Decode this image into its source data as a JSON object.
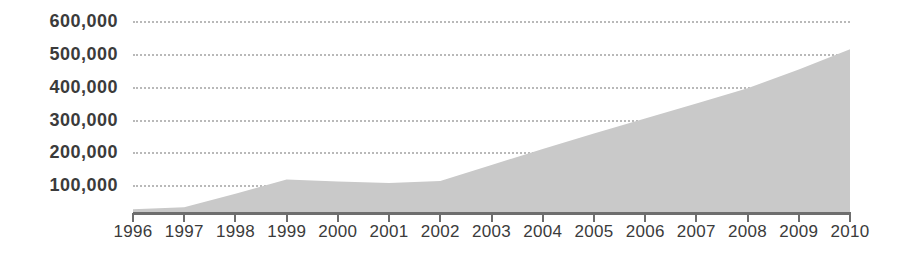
{
  "chart_data": {
    "type": "area",
    "title": "",
    "subtitle": "",
    "xlabel": "",
    "ylabel": "",
    "categories": [
      "1996",
      "1997",
      "1998",
      "1999",
      "2000",
      "2001",
      "2002",
      "2003",
      "2004",
      "2005",
      "2006",
      "2007",
      "2008",
      "2009",
      "2010"
    ],
    "values": [
      12000,
      18000,
      60000,
      105000,
      98000,
      94000,
      100000,
      150000,
      200000,
      248000,
      295000,
      342000,
      390000,
      448000,
      512000
    ],
    "series": [
      {
        "name": "Total",
        "values": [
          12000,
          18000,
          60000,
          105000,
          98000,
          94000,
          100000,
          150000,
          200000,
          248000,
          295000,
          342000,
          390000,
          448000,
          512000
        ]
      }
    ],
    "ylim": [
      0,
      600000
    ],
    "xlim": [
      "1996",
      "2010"
    ],
    "y_ticks": [
      600000,
      500000,
      400000,
      300000,
      200000,
      100000
    ],
    "y_tick_labels": [
      "600,000",
      "500,000",
      "400,000",
      "300,000",
      "200,000",
      "100,000"
    ],
    "x_tick_labels": [
      "1996",
      "1997",
      "1998",
      "1999",
      "2000",
      "2001",
      "2002",
      "2003",
      "2004",
      "2005",
      "2006",
      "2007",
      "2008",
      "2009",
      "2010"
    ],
    "grid": true,
    "grid_style": "dotted",
    "legend": false,
    "legend_position": "none",
    "colors": {
      "area_fill": "#c9c9c9",
      "gridline": "#b9b9b9",
      "axis": "#6e6e6e",
      "text": "#3b3b3b",
      "background": "#ffffff"
    }
  }
}
